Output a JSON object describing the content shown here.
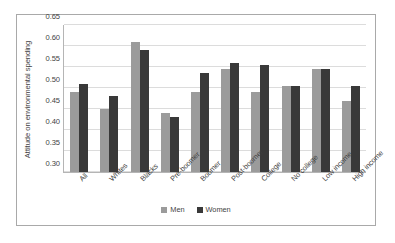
{
  "chart_data": {
    "type": "bar",
    "title": "",
    "xlabel": "",
    "ylabel": "Attitude on environmental spending",
    "ylim": [
      0.3,
      0.65
    ],
    "ytick_labels": [
      "0.65",
      "0.60",
      "0.55",
      "0.50",
      "0.45",
      "0.40",
      "0.35",
      "0.30"
    ],
    "ytick_values": [
      0.65,
      0.6,
      0.55,
      0.5,
      0.45,
      0.4,
      0.35,
      0.3
    ],
    "grid": true,
    "legend_position": "bottom",
    "categories": [
      "All",
      "Whites",
      "Blacks",
      "Pre-boomer",
      "Boomer",
      "Post-boomer",
      "College",
      "No college",
      "Low income",
      "High income"
    ],
    "series": [
      {
        "name": "Men",
        "color": "#9b9b9b",
        "values": [
          0.49,
          0.45,
          0.61,
          0.44,
          0.49,
          0.545,
          0.49,
          0.505,
          0.545,
          0.47
        ]
      },
      {
        "name": "Women",
        "color": "#393939",
        "values": [
          0.51,
          0.48,
          0.59,
          0.43,
          0.535,
          0.56,
          0.555,
          0.505,
          0.545,
          0.505
        ]
      }
    ]
  },
  "legend": {
    "items": [
      {
        "label": "Men"
      },
      {
        "label": "Women"
      }
    ]
  },
  "colors": {
    "men": "#9b9b9b",
    "women": "#393939",
    "gridline": "#dcdcdc",
    "axis": "#b5b5b5",
    "frame": "#a9a9a9",
    "text": "#3f3f3f"
  }
}
